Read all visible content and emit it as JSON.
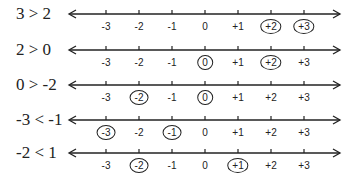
{
  "colors": {
    "ink": "#222222",
    "background": "#ffffff"
  },
  "ticks": [
    "-3",
    "-2",
    "-1",
    "0",
    "+1",
    "+2",
    "+3"
  ],
  "rows": [
    {
      "label": "3 > 2",
      "circled": [
        "+2",
        "+3"
      ]
    },
    {
      "label": "2 > 0",
      "circled": [
        "0",
        "+2"
      ]
    },
    {
      "label": "0 > -2",
      "circled": [
        "-2",
        "0"
      ]
    },
    {
      "label": "-3 < -1",
      "circled": [
        "-3",
        "-1"
      ]
    },
    {
      "label": "-2 < 1",
      "circled": [
        "-2",
        "+1"
      ]
    }
  ]
}
